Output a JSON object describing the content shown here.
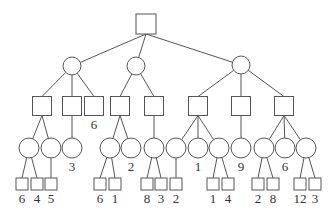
{
  "diagram": {
    "type": "game-tree",
    "colors": {
      "stroke": "#555555",
      "fill": "#ffffff",
      "text": "#333333"
    },
    "nodes": [
      {
        "id": "root",
        "shape": "square",
        "cx": 146,
        "cy": 24,
        "size": 20
      },
      {
        "id": "c1",
        "shape": "circle",
        "cx": 72,
        "cy": 66,
        "r": 9,
        "parent": "root"
      },
      {
        "id": "c2",
        "shape": "circle",
        "cx": 136,
        "cy": 66,
        "r": 9,
        "parent": "root"
      },
      {
        "id": "c3",
        "shape": "circle",
        "cx": 241,
        "cy": 65,
        "r": 9,
        "parent": "root"
      },
      {
        "id": "sA",
        "shape": "square",
        "cx": 42,
        "cy": 106,
        "size": 19,
        "parent": "c1"
      },
      {
        "id": "sB",
        "shape": "square",
        "cx": 72,
        "cy": 106,
        "size": 19,
        "parent": "c1"
      },
      {
        "id": "sC",
        "shape": "square",
        "cx": 94,
        "cy": 106,
        "size": 19,
        "parent": "c1",
        "label": "6"
      },
      {
        "id": "sD",
        "shape": "square",
        "cx": 120,
        "cy": 106,
        "size": 19,
        "parent": "c2"
      },
      {
        "id": "sE",
        "shape": "square",
        "cx": 154,
        "cy": 106,
        "size": 19,
        "parent": "c2"
      },
      {
        "id": "sF",
        "shape": "square",
        "cx": 198,
        "cy": 106,
        "size": 19,
        "parent": "c3"
      },
      {
        "id": "sG",
        "shape": "square",
        "cx": 241,
        "cy": 106,
        "size": 19,
        "parent": "c3"
      },
      {
        "id": "sH",
        "shape": "square",
        "cx": 284,
        "cy": 106,
        "size": 19,
        "parent": "c3"
      },
      {
        "id": "k1",
        "shape": "circle",
        "cx": 29,
        "cy": 148,
        "r": 10,
        "parent": "sA"
      },
      {
        "id": "k2",
        "shape": "circle",
        "cx": 51,
        "cy": 148,
        "r": 10,
        "parent": "sA"
      },
      {
        "id": "k3",
        "shape": "circle",
        "cx": 72,
        "cy": 148,
        "r": 10,
        "parent": "sB",
        "label": "3"
      },
      {
        "id": "k4",
        "shape": "circle",
        "cx": 110,
        "cy": 148,
        "r": 10,
        "parent": "sD"
      },
      {
        "id": "k5",
        "shape": "circle",
        "cx": 131,
        "cy": 148,
        "r": 10,
        "parent": "sD",
        "label": "2"
      },
      {
        "id": "k6",
        "shape": "circle",
        "cx": 154,
        "cy": 148,
        "r": 10,
        "parent": "sE"
      },
      {
        "id": "k7",
        "shape": "circle",
        "cx": 176,
        "cy": 148,
        "r": 10,
        "parent": "sF"
      },
      {
        "id": "k8",
        "shape": "circle",
        "cx": 198,
        "cy": 148,
        "r": 10,
        "parent": "sF",
        "label": "1"
      },
      {
        "id": "k9",
        "shape": "circle",
        "cx": 219,
        "cy": 148,
        "r": 10,
        "parent": "sF"
      },
      {
        "id": "k10",
        "shape": "circle",
        "cx": 241,
        "cy": 148,
        "r": 10,
        "parent": "sG",
        "label": "9"
      },
      {
        "id": "k11",
        "shape": "circle",
        "cx": 264,
        "cy": 148,
        "r": 10,
        "parent": "sH"
      },
      {
        "id": "k12",
        "shape": "circle",
        "cx": 285,
        "cy": 148,
        "r": 10,
        "parent": "sH",
        "label": "6"
      },
      {
        "id": "k13",
        "shape": "circle",
        "cx": 306,
        "cy": 148,
        "r": 10,
        "parent": "sH"
      },
      {
        "id": "l1",
        "shape": "square",
        "cx": 22,
        "cy": 184,
        "size": 12,
        "parent": "k1",
        "label": "6"
      },
      {
        "id": "l2",
        "shape": "square",
        "cx": 37,
        "cy": 184,
        "size": 12,
        "parent": "k1",
        "label": "4"
      },
      {
        "id": "l3",
        "shape": "square",
        "cx": 51,
        "cy": 184,
        "size": 12,
        "parent": "k2",
        "label": "5"
      },
      {
        "id": "l4",
        "shape": "square",
        "cx": 100,
        "cy": 184,
        "size": 12,
        "parent": "k4",
        "label": "6"
      },
      {
        "id": "l5",
        "shape": "square",
        "cx": 115,
        "cy": 184,
        "size": 12,
        "parent": "k4",
        "label": "1"
      },
      {
        "id": "l6",
        "shape": "square",
        "cx": 147,
        "cy": 184,
        "size": 12,
        "parent": "k6",
        "label": "8"
      },
      {
        "id": "l7",
        "shape": "square",
        "cx": 161,
        "cy": 184,
        "size": 12,
        "parent": "k6",
        "label": "3"
      },
      {
        "id": "l8",
        "shape": "square",
        "cx": 176,
        "cy": 184,
        "size": 12,
        "parent": "k7",
        "label": "2"
      },
      {
        "id": "l9",
        "shape": "square",
        "cx": 213,
        "cy": 184,
        "size": 12,
        "parent": "k9",
        "label": "1"
      },
      {
        "id": "l10",
        "shape": "square",
        "cx": 228,
        "cy": 184,
        "size": 12,
        "parent": "k9",
        "label": "4"
      },
      {
        "id": "l11",
        "shape": "square",
        "cx": 258,
        "cy": 184,
        "size": 12,
        "parent": "k11",
        "label": "2"
      },
      {
        "id": "l12",
        "shape": "square",
        "cx": 273,
        "cy": 184,
        "size": 12,
        "parent": "k11",
        "label": "8"
      },
      {
        "id": "l13",
        "shape": "square",
        "cx": 300,
        "cy": 184,
        "size": 12,
        "parent": "k13",
        "label": "12"
      },
      {
        "id": "l14",
        "shape": "square",
        "cx": 315,
        "cy": 184,
        "size": 12,
        "parent": "k13",
        "label": "3"
      }
    ]
  }
}
